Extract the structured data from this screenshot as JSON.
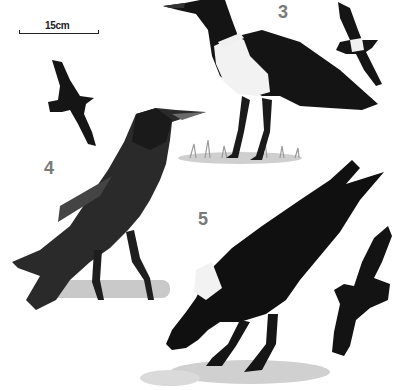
{
  "image": {
    "description": "Field-guide illustration plate of corvids: perched and flying birds",
    "background": "#ffffff",
    "ink": "#111111"
  },
  "scale_bar": {
    "label": "15cm"
  },
  "figures": [
    {
      "number": "3",
      "subject": "pied crow perched on grass, with flight silhouette",
      "number_color": "#7a7a7a"
    },
    {
      "number": "4",
      "subject": "rook perched on branch, with flight silhouette",
      "number_color": "#7a7a7a"
    },
    {
      "number": "5",
      "subject": "white-necked raven foraging on rock, with flight silhouette",
      "number_color": "#7a7a7a"
    }
  ]
}
